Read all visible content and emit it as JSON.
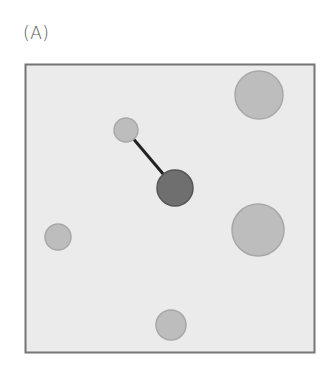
{
  "panel": {
    "label": "(A)",
    "box": {
      "x": 25,
      "y": 64,
      "width": 289,
      "height": 288,
      "fill": "#ebebeb",
      "stroke": "#757575"
    }
  },
  "colors": {
    "light_node_fill": "#bdbdbd",
    "light_node_stroke": "#a8a8a8",
    "dark_node_fill": "#6f6f6f",
    "dark_node_stroke": "#555555",
    "edge": "#222222"
  },
  "nodes": [
    {
      "id": "top-right",
      "cx": 259,
      "cy": 95,
      "r": 24,
      "type": "light"
    },
    {
      "id": "small-upper-left",
      "cx": 126,
      "cy": 130,
      "r": 12,
      "type": "light"
    },
    {
      "id": "center-dark",
      "cx": 175,
      "cy": 188,
      "r": 18,
      "type": "dark"
    },
    {
      "id": "right-large",
      "cx": 258,
      "cy": 230,
      "r": 26,
      "type": "light"
    },
    {
      "id": "left",
      "cx": 58,
      "cy": 237,
      "r": 13,
      "type": "light"
    },
    {
      "id": "bottom",
      "cx": 171,
      "cy": 325,
      "r": 15,
      "type": "light"
    }
  ],
  "edges": [
    {
      "from": "small-upper-left",
      "to": "center-dark"
    }
  ]
}
